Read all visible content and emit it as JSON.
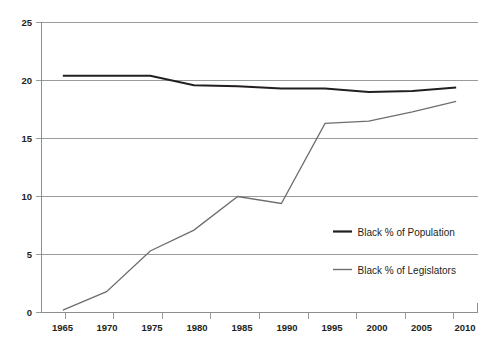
{
  "chart_data": {
    "type": "line",
    "title": "",
    "subtitle": "",
    "xlabel": "",
    "ylabel": "",
    "x": [
      1965,
      1970,
      1975,
      1980,
      1985,
      1990,
      1995,
      2000,
      2005,
      2010
    ],
    "categories": [
      "1965",
      "1970",
      "1975",
      "1980",
      "1985",
      "1990",
      "1995",
      "2000",
      "2005",
      "2010"
    ],
    "xlim": [
      1965,
      2010
    ],
    "ylim": [
      0,
      25
    ],
    "yticks": [
      0,
      5,
      10,
      15,
      20,
      25
    ],
    "ytick_labels": [
      "0",
      "5",
      "10",
      "15",
      "20",
      "25"
    ],
    "grid": "horizontal",
    "legend_position": "inside-right",
    "series": [
      {
        "name": "Black % of Population",
        "color": "#231f20",
        "width": 2.0,
        "values": [
          20.4,
          20.4,
          20.4,
          19.6,
          19.5,
          19.3,
          19.3,
          19.0,
          19.1,
          19.4
        ]
      },
      {
        "name": "Black % of Legislators",
        "color": "#6d6e71",
        "width": 1.3,
        "values": [
          0.2,
          1.8,
          5.3,
          7.1,
          10.0,
          9.4,
          16.3,
          16.5,
          17.3,
          18.2
        ]
      }
    ]
  },
  "axes": {
    "y_labels": [
      "25",
      "20",
      "15",
      "10",
      "5",
      "0"
    ],
    "x_labels": [
      "1965",
      "1970",
      "1975",
      "1980",
      "1985",
      "1990",
      "1995",
      "2000",
      "2005",
      "2010"
    ]
  },
  "legend": {
    "entries": [
      {
        "label": "Black % of Population",
        "color": "#231f20",
        "swatch": "line-swatch-thick"
      },
      {
        "label": "Black % of Legislators",
        "color": "#6d6e71",
        "swatch": "line-swatch-thin"
      }
    ]
  },
  "colors": {
    "population_line": "#231f20",
    "legislators_line": "#6d6e71",
    "grid": "#808285",
    "text": "#231f20",
    "background": "#ffffff"
  }
}
